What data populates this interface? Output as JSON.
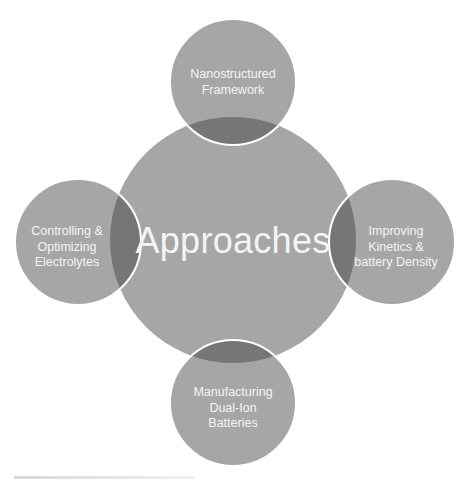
{
  "diagram": {
    "type": "venn-hub-and-spoke",
    "center": {
      "label": "Approaches"
    },
    "satellites": [
      {
        "position": "top",
        "label": "Nanostructured Framework",
        "lines": [
          "Nanostructured",
          "Framework"
        ]
      },
      {
        "position": "right",
        "label": "Improving Kinetics & battery Density",
        "lines": [
          "Improving",
          "Kinetics &",
          "battery Density"
        ]
      },
      {
        "position": "bottom",
        "label": "Manufacturing Dual-Ion Batteries",
        "lines": [
          "Manufacturing",
          "Dual-Ion",
          "Batteries"
        ]
      },
      {
        "position": "left",
        "label": "Controlling & Optimizing Electrolytes",
        "lines": [
          "Controlling &",
          "Optimizing",
          "Electrolytes"
        ]
      }
    ],
    "colors": {
      "circle_fill": "#a6a6a6",
      "overlap_fill": "#767676",
      "outline": "#ffffff",
      "text": "#f4f4f4"
    }
  }
}
